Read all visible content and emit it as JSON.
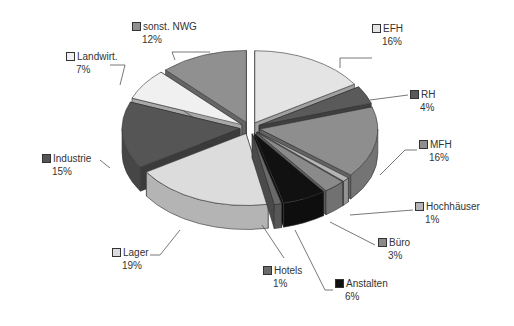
{
  "chart_data": {
    "type": "pie",
    "style": "3d-exploded",
    "title": "",
    "unit": "%",
    "categories": [
      "EFH",
      "RH",
      "MFH",
      "Hochhäuser",
      "Büro",
      "Anstalten",
      "Hotels",
      "Lager",
      "Industrie",
      "Landwirt.",
      "sonst. NWG"
    ],
    "values": [
      16,
      4,
      16,
      1,
      3,
      6,
      1,
      19,
      15,
      7,
      12
    ],
    "labels": [
      "16%",
      "4%",
      "16%",
      "1%",
      "3%",
      "6%",
      "1%",
      "19%",
      "15%",
      "7%",
      "12%"
    ],
    "colors": [
      "#e4e4e4",
      "#5a5a5a",
      "#8e8e8e",
      "#b4b4b4",
      "#8a8a8a",
      "#111111",
      "#6a6a6a",
      "#dcdcdc",
      "#555555",
      "#f0f0f0",
      "#909090"
    ],
    "legend_position": "callouts",
    "label_positions": [
      {
        "x": 372,
        "y": 22,
        "line": [
          [
            340,
            68
          ],
          [
            340,
            58
          ],
          [
            372,
            58
          ]
        ]
      },
      {
        "x": 410,
        "y": 88,
        "line": [
          [
            370,
            100
          ],
          [
            408,
            95
          ]
        ]
      },
      {
        "x": 419,
        "y": 138,
        "line": [
          [
            380,
            175
          ],
          [
            405,
            150
          ],
          [
            417,
            150
          ]
        ]
      },
      {
        "x": 415,
        "y": 200,
        "line": [
          [
            350,
            215
          ],
          [
            413,
            210
          ]
        ]
      },
      {
        "x": 378,
        "y": 236,
        "line": [
          [
            330,
            222
          ],
          [
            375,
            245
          ]
        ]
      },
      {
        "x": 335,
        "y": 277,
        "line": [
          [
            295,
            230
          ],
          [
            325,
            290
          ],
          [
            333,
            290
          ]
        ]
      },
      {
        "x": 263,
        "y": 264,
        "line": [
          [
            262,
            225
          ],
          [
            284,
            258
          ]
        ]
      },
      {
        "x": 112,
        "y": 246,
        "line": [
          [
            180,
            230
          ],
          [
            160,
            255
          ],
          [
            150,
            255
          ]
        ]
      },
      {
        "x": 42,
        "y": 152,
        "line": [
          [
            110,
            168
          ],
          [
            100,
            160
          ]
        ]
      },
      {
        "x": 66,
        "y": 50,
        "line": [
          [
            120,
            85
          ],
          [
            125,
            65
          ],
          [
            110,
            65
          ]
        ]
      },
      {
        "x": 132,
        "y": 20,
        "line": [
          [
            175,
            60
          ],
          [
            172,
            52
          ],
          [
            210,
            52
          ]
        ]
      }
    ]
  }
}
